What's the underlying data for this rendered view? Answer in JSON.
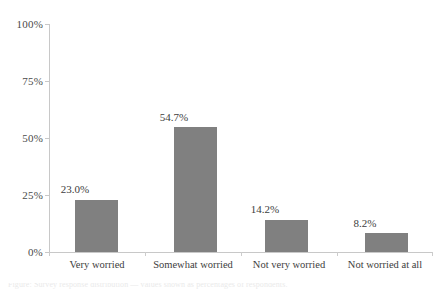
{
  "chart_data": {
    "type": "bar",
    "title": "",
    "subtitle": "",
    "xlabel": "",
    "ylabel": "",
    "categories": [
      "Very worried",
      "Somewhat worried",
      "Not very worried",
      "Not worried at all"
    ],
    "values": [
      23.0,
      54.7,
      14.2,
      8.2
    ],
    "value_labels": [
      "23.0%",
      "54.7%",
      "14.2%",
      "8.2%"
    ],
    "ylim": [
      0,
      100
    ],
    "y_ticks": [
      0,
      25,
      50,
      75,
      100
    ],
    "y_tick_labels": [
      "0%",
      "25%",
      "50%",
      "75%",
      "100%"
    ],
    "grid": false,
    "legend": null,
    "series": [
      {
        "name": "",
        "values": [
          23.0,
          54.7,
          14.2,
          8.2
        ]
      }
    ],
    "colors": {
      "bar": "#808080",
      "axis": "#c8c8c8",
      "text": "#3d3d3d",
      "background": "#ffffff"
    }
  },
  "caption": {
    "clipped_text": "Figure: Survey response distribution — values shown as percentages of respondents."
  }
}
